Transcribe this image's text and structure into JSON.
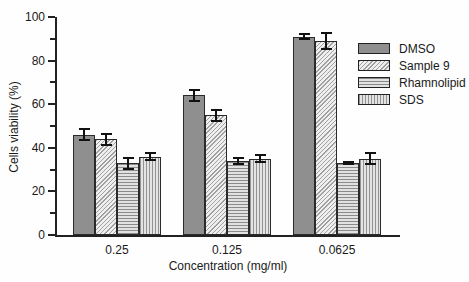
{
  "chart_data": {
    "type": "bar",
    "xlabel": "Concentration (mg/ml)",
    "ylabel": "Cells viability (%)",
    "ylim": [
      0,
      100
    ],
    "yticks": [
      0,
      20,
      40,
      60,
      80,
      100
    ],
    "minor_ticks_every": 10,
    "grid": false,
    "categories": [
      "0.25",
      "0.125",
      "0.0625"
    ],
    "series": [
      {
        "name": "DMSO",
        "pattern": "solid",
        "values": [
          46,
          64,
          91
        ],
        "errors": [
          3,
          3,
          1.5
        ]
      },
      {
        "name": "Sample 9",
        "pattern": "diagonal-hatch",
        "values": [
          44,
          55,
          89
        ],
        "errors": [
          3,
          3,
          4
        ]
      },
      {
        "name": "Rhamnolipid",
        "pattern": "horizontal-lines",
        "values": [
          33,
          34,
          33
        ],
        "errors": [
          3,
          2,
          1
        ]
      },
      {
        "name": "SDS",
        "pattern": "vertical-lines",
        "values": [
          36,
          35,
          35
        ],
        "errors": [
          2,
          2,
          3
        ]
      }
    ],
    "legend": {
      "position": "right",
      "entries": [
        "DMSO",
        "Sample 9",
        "Rhamnolipid",
        "SDS"
      ]
    },
    "colors": {
      "background": "#fefefe",
      "axis": "#222222",
      "text": "#1a1a1a",
      "error_bar": "#111111",
      "bar_border": "#2a2a2a",
      "dmso_fill": "#8f8f8f",
      "hatch_bg": "#efefef",
      "hatch_line": "#a0a0a0",
      "hlines_bg": "#e2e2e2",
      "hlines_line": "#8a8a8a",
      "vlines_bg": "#e4e4e4",
      "vlines_line": "#929292"
    }
  }
}
